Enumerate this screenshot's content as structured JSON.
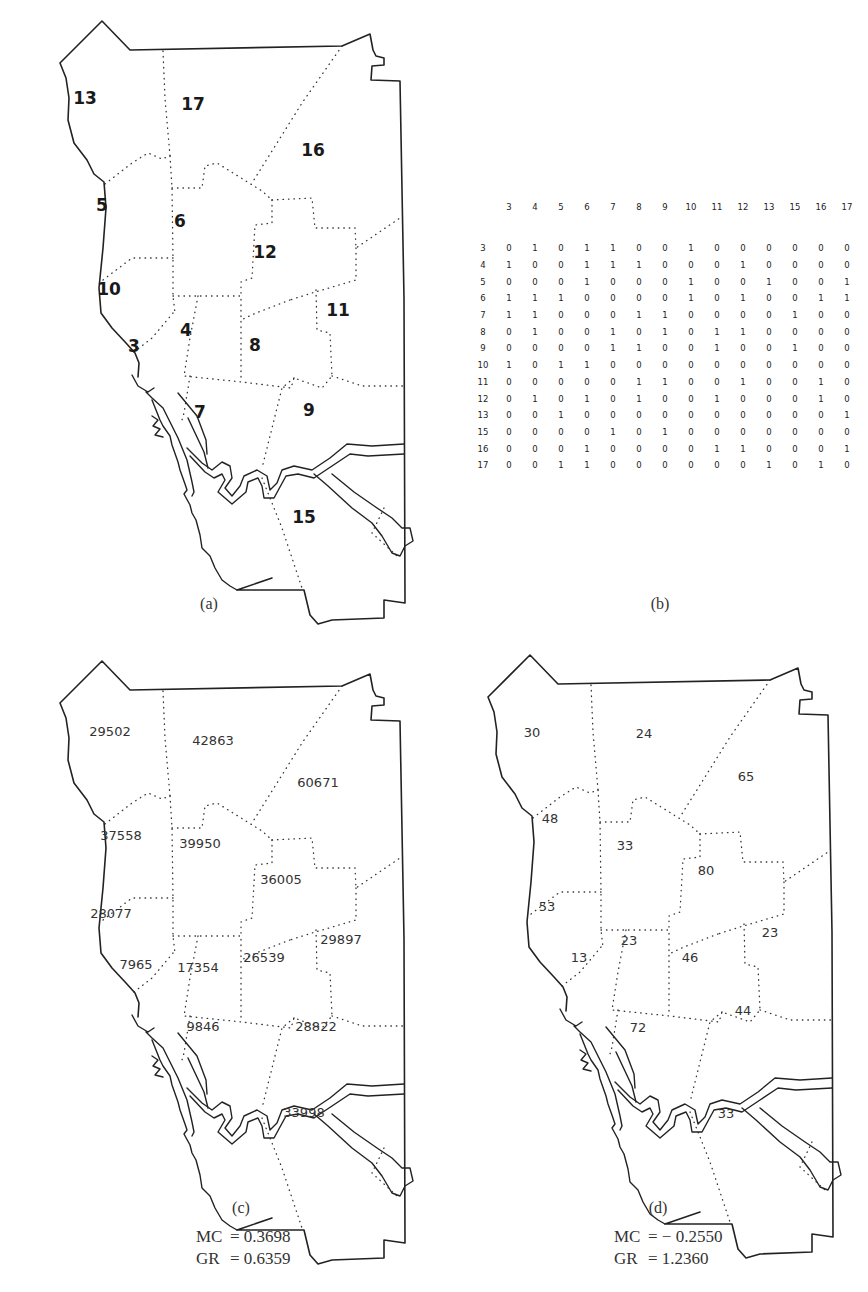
{
  "figure": {
    "panels": {
      "a": {
        "caption": "(a)",
        "region_labels": [
          {
            "id": 13,
            "text": "13",
            "x": 85,
            "y": 98
          },
          {
            "id": 17,
            "text": "17",
            "x": 193,
            "y": 104
          },
          {
            "id": 16,
            "text": "16",
            "x": 313,
            "y": 150
          },
          {
            "id": 5,
            "text": "5",
            "x": 102,
            "y": 205
          },
          {
            "id": 6,
            "text": "6",
            "x": 180,
            "y": 221
          },
          {
            "id": 12,
            "text": "12",
            "x": 265,
            "y": 252
          },
          {
            "id": 10,
            "text": "10",
            "x": 109,
            "y": 289
          },
          {
            "id": 11,
            "text": "11",
            "x": 338,
            "y": 310
          },
          {
            "id": 4,
            "text": "4",
            "x": 186,
            "y": 330
          },
          {
            "id": 3,
            "text": "3",
            "x": 134,
            "y": 346
          },
          {
            "id": 8,
            "text": "8",
            "x": 255,
            "y": 345
          },
          {
            "id": 7,
            "text": "7",
            "x": 200,
            "y": 412
          },
          {
            "id": 9,
            "text": "9",
            "x": 309,
            "y": 410
          },
          {
            "id": 15,
            "text": "15",
            "x": 304,
            "y": 517
          }
        ]
      },
      "b": {
        "caption": "(b)",
        "matrix": {
          "column_headers": [
            "3",
            "4",
            "5",
            "6",
            "7",
            "8",
            "9",
            "10",
            "11",
            "12",
            "13",
            "15",
            "16",
            "17"
          ],
          "rows": [
            {
              "label": "3",
              "values": [
                0,
                1,
                0,
                1,
                1,
                0,
                0,
                1,
                0,
                0,
                0,
                0,
                0,
                0
              ]
            },
            {
              "label": "4",
              "values": [
                1,
                0,
                0,
                1,
                1,
                1,
                0,
                0,
                0,
                1,
                0,
                0,
                0,
                0
              ]
            },
            {
              "label": "5",
              "values": [
                0,
                0,
                0,
                1,
                0,
                0,
                0,
                1,
                0,
                0,
                1,
                0,
                0,
                1
              ]
            },
            {
              "label": "6",
              "values": [
                1,
                1,
                1,
                0,
                0,
                0,
                0,
                1,
                0,
                1,
                0,
                0,
                1,
                1
              ]
            },
            {
              "label": "7",
              "values": [
                1,
                1,
                0,
                0,
                0,
                1,
                1,
                0,
                0,
                0,
                0,
                1,
                0,
                0
              ]
            },
            {
              "label": "8",
              "values": [
                0,
                1,
                0,
                0,
                1,
                0,
                1,
                0,
                1,
                1,
                0,
                0,
                0,
                0
              ]
            },
            {
              "label": "9",
              "values": [
                0,
                0,
                0,
                0,
                1,
                1,
                0,
                0,
                1,
                0,
                0,
                1,
                0,
                0
              ]
            },
            {
              "label": "10",
              "values": [
                1,
                0,
                1,
                1,
                0,
                0,
                0,
                0,
                0,
                0,
                0,
                0,
                0,
                0
              ]
            },
            {
              "label": "11",
              "values": [
                0,
                0,
                0,
                0,
                0,
                1,
                1,
                0,
                0,
                1,
                0,
                0,
                1,
                0
              ]
            },
            {
              "label": "12",
              "values": [
                0,
                1,
                0,
                1,
                0,
                1,
                0,
                0,
                1,
                0,
                0,
                0,
                1,
                0
              ]
            },
            {
              "label": "13",
              "values": [
                0,
                0,
                1,
                0,
                0,
                0,
                0,
                0,
                0,
                0,
                0,
                0,
                0,
                1
              ]
            },
            {
              "label": "15",
              "values": [
                0,
                0,
                0,
                0,
                1,
                0,
                1,
                0,
                0,
                0,
                0,
                0,
                0,
                0
              ]
            },
            {
              "label": "16",
              "values": [
                0,
                0,
                0,
                1,
                0,
                0,
                0,
                0,
                1,
                1,
                0,
                0,
                0,
                1
              ]
            },
            {
              "label": "17",
              "values": [
                0,
                0,
                1,
                1,
                0,
                0,
                0,
                0,
                0,
                0,
                1,
                0,
                1,
                0
              ]
            }
          ]
        }
      },
      "c": {
        "caption": "(c)",
        "stats": {
          "mc_label": "MC",
          "mc_value": "= 0.3698",
          "gr_label": "GR",
          "gr_value": "= 0.6359"
        },
        "region_labels": [
          {
            "id": 13,
            "text": "29502",
            "x": 110,
            "y": 731
          },
          {
            "id": 17,
            "text": "42863",
            "x": 213,
            "y": 740
          },
          {
            "id": 16,
            "text": "60671",
            "x": 318,
            "y": 782
          },
          {
            "id": 5,
            "text": "37558",
            "x": 121,
            "y": 835
          },
          {
            "id": 6,
            "text": "39950",
            "x": 200,
            "y": 843
          },
          {
            "id": 12,
            "text": "36005",
            "x": 281,
            "y": 879
          },
          {
            "id": 10,
            "text": "28077",
            "x": 111,
            "y": 913
          },
          {
            "id": 11,
            "text": "29897",
            "x": 341,
            "y": 939
          },
          {
            "id": 3,
            "text": "7965",
            "x": 136,
            "y": 964
          },
          {
            "id": 4,
            "text": "17354",
            "x": 198,
            "y": 967
          },
          {
            "id": 8,
            "text": "26539",
            "x": 264,
            "y": 957
          },
          {
            "id": 7,
            "text": "9846",
            "x": 203,
            "y": 1026
          },
          {
            "id": 9,
            "text": "28822",
            "x": 316,
            "y": 1026
          },
          {
            "id": 15,
            "text": "33998",
            "x": 304,
            "y": 1112
          }
        ]
      },
      "d": {
        "caption": "(d)",
        "stats": {
          "mc_label": "MC",
          "mc_value": "= − 0.2550",
          "gr_label": "GR",
          "gr_value": "= 1.2360"
        },
        "region_labels": [
          {
            "id": 13,
            "text": "30",
            "x": 532,
            "y": 732
          },
          {
            "id": 17,
            "text": "24",
            "x": 644,
            "y": 733
          },
          {
            "id": 16,
            "text": "65",
            "x": 746,
            "y": 776
          },
          {
            "id": 5,
            "text": "48",
            "x": 550,
            "y": 818
          },
          {
            "id": 6,
            "text": "33",
            "x": 625,
            "y": 845
          },
          {
            "id": 12,
            "text": "80",
            "x": 706,
            "y": 870
          },
          {
            "id": 10,
            "text": "53",
            "x": 547,
            "y": 906
          },
          {
            "id": 11,
            "text": "23",
            "x": 770,
            "y": 932
          },
          {
            "id": 3,
            "text": "13",
            "x": 579,
            "y": 957
          },
          {
            "id": 4,
            "text": "23",
            "x": 629,
            "y": 940
          },
          {
            "id": 8,
            "text": "46",
            "x": 690,
            "y": 957
          },
          {
            "id": 7,
            "text": "72",
            "x": 638,
            "y": 1027
          },
          {
            "id": 9,
            "text": "44",
            "x": 743,
            "y": 1010
          },
          {
            "id": 15,
            "text": "33",
            "x": 726,
            "y": 1113
          }
        ]
      }
    }
  }
}
